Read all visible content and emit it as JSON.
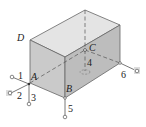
{
  "diagram": {
    "colors": {
      "front_face": "#c8c8c8",
      "side_face": "#b8b8b8",
      "top_face": "#e2e2e2",
      "edge": "#666666",
      "support_highlight": "#dcdcdc"
    },
    "point_labels": [
      {
        "id": "D",
        "text": "D"
      },
      {
        "id": "A",
        "text": "A"
      },
      {
        "id": "B",
        "text": "B"
      },
      {
        "id": "C",
        "text": "C"
      }
    ],
    "link_labels": [
      {
        "id": "1",
        "text": "1"
      },
      {
        "id": "2",
        "text": "2"
      },
      {
        "id": "3",
        "text": "3"
      },
      {
        "id": "4",
        "text": "4"
      },
      {
        "id": "5",
        "text": "5"
      },
      {
        "id": "6",
        "text": "6"
      }
    ]
  }
}
